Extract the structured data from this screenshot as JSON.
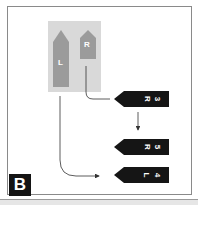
{
  "figure": {
    "panel_label": "B",
    "colors": {
      "frame_border": "#8a8a8a",
      "source_box": "#d9d9d9",
      "source_arrow": "#9b9b9b",
      "tag_fill": "#151515",
      "tag_text": "#ffffff",
      "connector": "#333333"
    },
    "source_arrows": [
      {
        "id": "left",
        "label": "L"
      },
      {
        "id": "right",
        "label": "R"
      }
    ],
    "tags": [
      {
        "id": "tag-r3",
        "side": "R",
        "number": "3"
      },
      {
        "id": "tag-r5",
        "side": "R",
        "number": "5"
      },
      {
        "id": "tag-l4",
        "side": "L",
        "number": "4"
      }
    ]
  }
}
